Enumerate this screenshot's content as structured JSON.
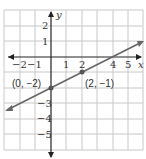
{
  "graph": {
    "x_axis_label": "x",
    "y_axis_label": "y",
    "x_ticks": [
      "−2",
      "−1",
      "1",
      "2",
      "4",
      "5"
    ],
    "y_ticks": [
      "2",
      "1",
      "−3",
      "−4",
      "−5"
    ],
    "points": [
      {
        "label": "(0, −2)",
        "x": 0,
        "y": -2
      },
      {
        "label": "(2, −1)",
        "x": 2,
        "y": -1
      }
    ],
    "line": {
      "slope": 0.5,
      "intercept": -2,
      "color": "#666666"
    }
  }
}
